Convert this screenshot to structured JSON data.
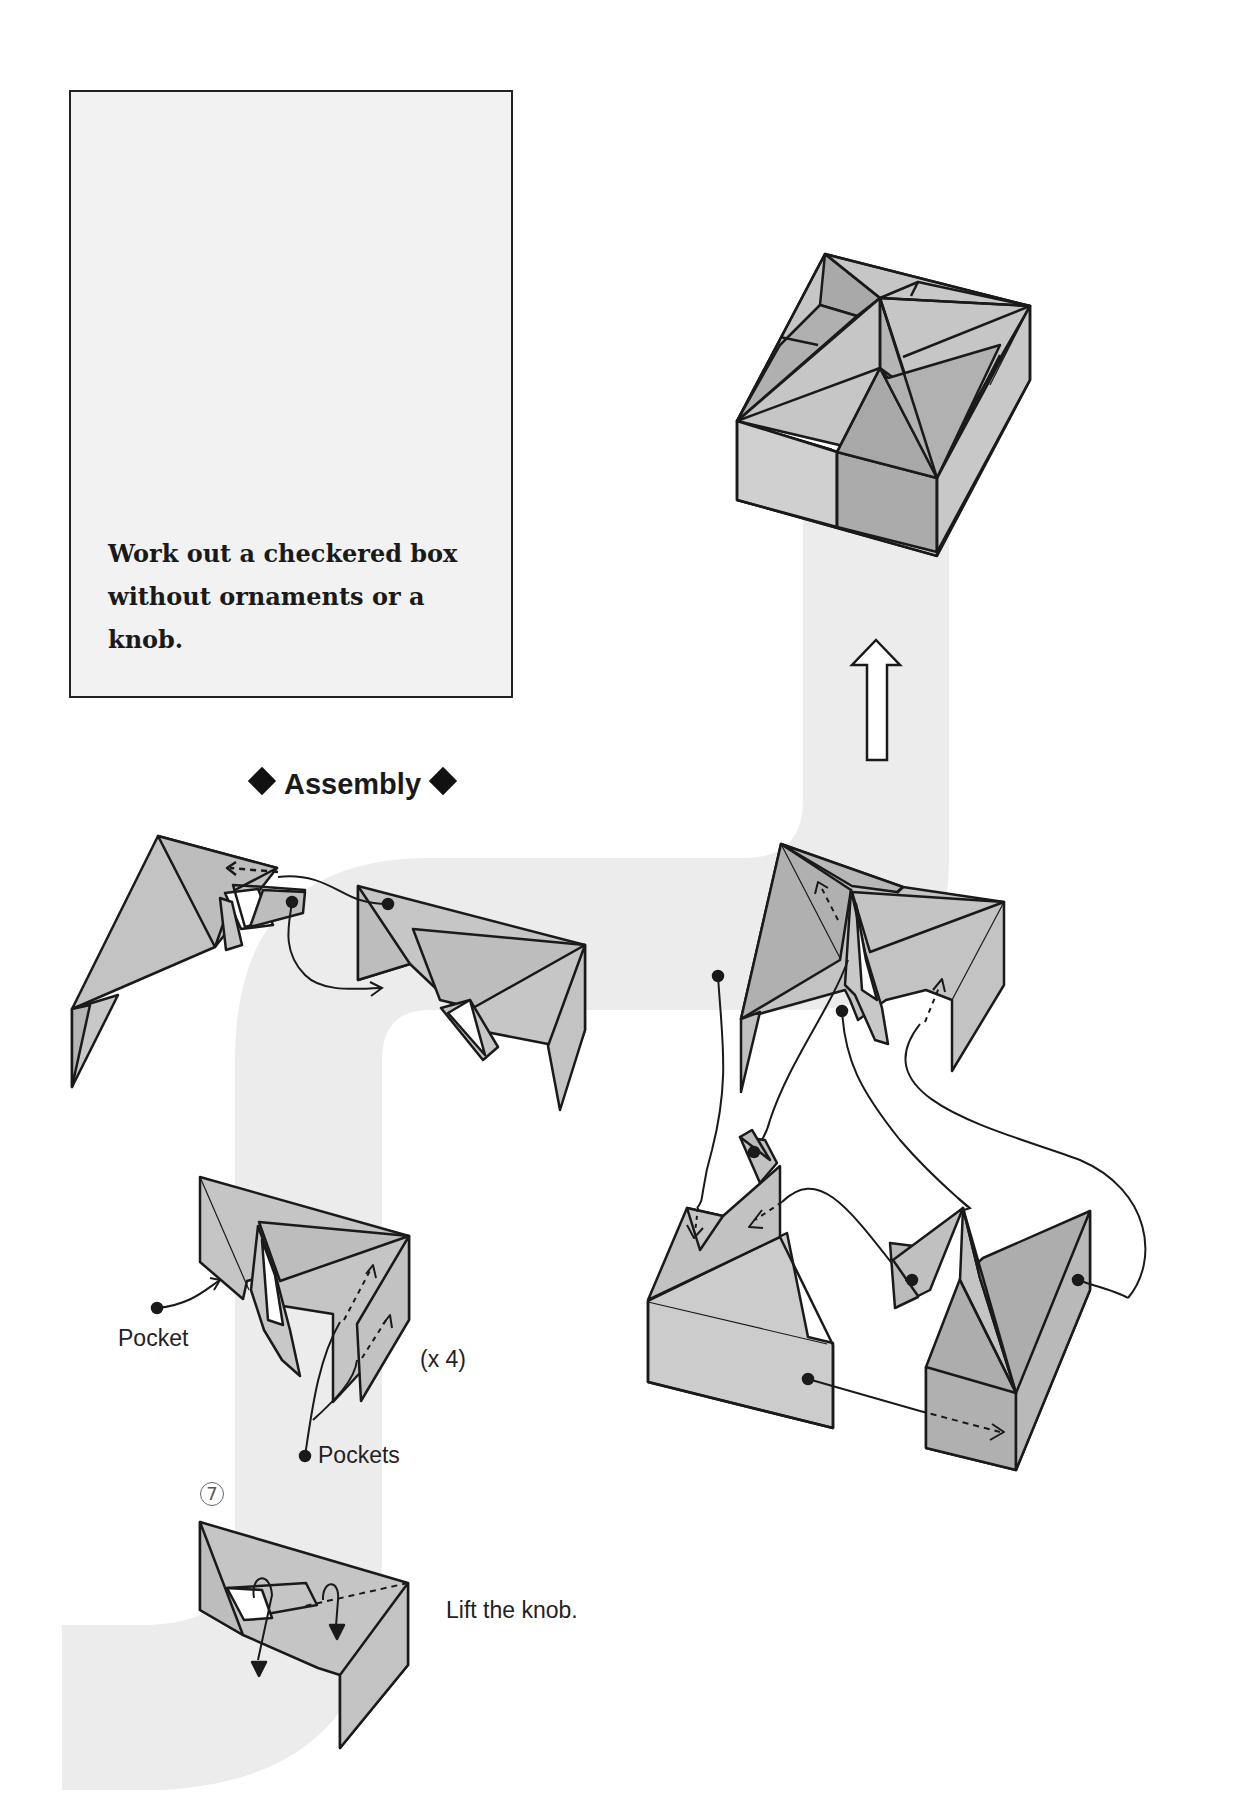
{
  "intro": {
    "text": "Work out a checkered box without ornaments or a knob."
  },
  "assembly": {
    "title": "Assembly",
    "left_diamond": "diamond-bullet",
    "right_diamond": "diamond-bullet"
  },
  "labels": {
    "pocket": "Pocket",
    "pockets": "Pockets",
    "repeat": "(x 4)",
    "step_number": "7",
    "lift_instruction": "Lift the knob."
  },
  "icons": {
    "up_arrow": "hollow-up-arrow"
  },
  "colors": {
    "path_band": "#ececec",
    "face_light": "#cfcfcf",
    "face_dark": "#a9a9a9",
    "face_mid": "#bdbdbd",
    "stroke": "#1a1a1a",
    "intro_bg": "#f2f2f2"
  }
}
